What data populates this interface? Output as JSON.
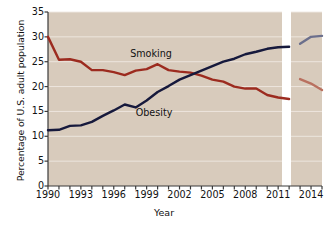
{
  "chart_data": {
    "type": "line",
    "title": "",
    "xlabel": "Year",
    "ylabel": "Percentage of U.S. adult population",
    "xlim": [
      1990,
      2015
    ],
    "ylim": [
      0,
      35
    ],
    "yticks": [
      0,
      5,
      10,
      15,
      20,
      25,
      30,
      35
    ],
    "xticks": [
      1990,
      1991,
      1992,
      1993,
      1994,
      1995,
      1996,
      1997,
      1998,
      1999,
      2000,
      2001,
      2002,
      2003,
      2004,
      2005,
      2006,
      2007,
      2008,
      2009,
      2010,
      2011,
      2012,
      2013,
      2014,
      2015
    ],
    "xtick_labels": [
      "1990",
      "",
      "",
      "1993",
      "",
      "",
      "1996",
      "",
      "",
      "1999",
      "",
      "",
      "2002",
      "",
      "",
      "2005",
      "",
      "",
      "2008",
      "",
      "",
      "2011",
      "",
      "",
      "2014",
      ""
    ],
    "grid": true,
    "grid_axis": "y",
    "legend": "inline-annotations",
    "plot_background": "#d8cbbc",
    "axis_break": {
      "present": true,
      "between_years": [
        2012,
        2013
      ],
      "note": "white vertical gap splits the panel"
    },
    "series": [
      {
        "name": "Smoking",
        "color": "#9c2b1f",
        "faded_color": "#b9705f",
        "x": [
          1990,
          1991,
          1992,
          1993,
          1994,
          1995,
          1996,
          1997,
          1998,
          1999,
          2000,
          2001,
          2002,
          2003,
          2004,
          2005,
          2006,
          2007,
          2008,
          2009,
          2010,
          2011,
          2012
        ],
        "values": [
          30.0,
          25.4,
          25.5,
          25.0,
          23.3,
          23.3,
          22.9,
          22.3,
          23.2,
          23.5,
          24.5,
          23.3,
          23.0,
          22.8,
          22.2,
          21.4,
          21.0,
          20.0,
          19.6,
          19.6,
          18.3,
          17.8,
          17.5
        ],
        "faded_x": [
          2013,
          2014,
          2015
        ],
        "faded_values": [
          21.5,
          20.6,
          19.3
        ]
      },
      {
        "name": "Obesity",
        "color": "#16193c",
        "faded_color": "#6b6f8c",
        "x": [
          1990,
          1991,
          1992,
          1993,
          1994,
          1995,
          1996,
          1997,
          1998,
          1999,
          2000,
          2001,
          2002,
          2003,
          2004,
          2005,
          2006,
          2007,
          2008,
          2009,
          2010,
          2011,
          2012
        ],
        "values": [
          11.2,
          11.3,
          12.1,
          12.2,
          12.9,
          14.1,
          15.2,
          16.4,
          15.8,
          17.2,
          18.9,
          20.1,
          21.4,
          22.3,
          23.2,
          24.1,
          25.0,
          25.6,
          26.5,
          27.0,
          27.6,
          27.9,
          28.0
        ],
        "faded_x": [
          2013,
          2014,
          2015
        ],
        "faded_values": [
          28.6,
          30.0,
          30.2
        ]
      }
    ],
    "annotations": [
      {
        "text": "Smoking",
        "year": 1997.5,
        "value": 26.5
      },
      {
        "text": "Obesity",
        "year": 1998.0,
        "value": 14.6
      }
    ]
  }
}
